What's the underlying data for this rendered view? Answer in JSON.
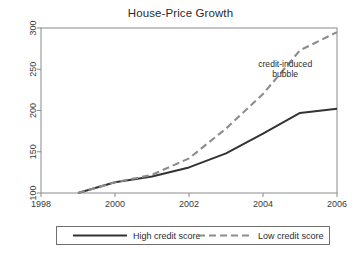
{
  "chart_data": {
    "type": "line",
    "title": "House-Price Growth",
    "xlabel": "",
    "ylabel": "",
    "xlim": [
      1998,
      2006
    ],
    "ylim": [
      100,
      300
    ],
    "grid": false,
    "legend_position": "bottom",
    "x_ticks": [
      "1998",
      "2000",
      "2002",
      "2004",
      "2006"
    ],
    "x_tick_values": [
      1998,
      2000,
      2002,
      2004,
      2006
    ],
    "y_ticks": [
      "100",
      "150",
      "200",
      "250",
      "300"
    ],
    "y_tick_values": [
      100,
      150,
      200,
      250,
      300
    ],
    "x": [
      1999,
      2000,
      2001,
      2002,
      2003,
      2004,
      2005,
      2006
    ],
    "series": [
      {
        "name": "High credit score",
        "style": "solid",
        "color": "#333333",
        "values": [
          100,
          113,
          120,
          131,
          148,
          172,
          197,
          202
        ]
      },
      {
        "name": "Low credit score",
        "style": "dashed",
        "color": "#8c8c8c",
        "values": [
          100,
          113,
          122,
          142,
          178,
          220,
          273,
          295
        ]
      }
    ],
    "annotations": [
      {
        "name": "credit-induced-bubble",
        "lines": [
          "credit-induced",
          "bubble"
        ],
        "x": 2004.6,
        "y": 253
      }
    ]
  },
  "legend": {
    "entries": [
      {
        "label": "High credit score",
        "style": "solid",
        "color": "#333333"
      },
      {
        "label": "Low credit score",
        "style": "dashed",
        "color": "#8c8c8c"
      }
    ]
  },
  "colors": {
    "high_credit": "#333333",
    "low_credit": "#8c8c8c",
    "axis": "#7a7a7a",
    "text": "#2b2b2b",
    "background": "#ffffff"
  }
}
